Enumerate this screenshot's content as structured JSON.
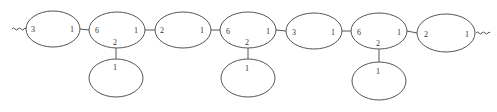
{
  "diagram": {
    "type": "chain-graph",
    "chain_nodes": [
      {
        "id": "A",
        "cx": 53,
        "cy": 29,
        "rx": 27,
        "ry": 18,
        "left": "3",
        "right": "1",
        "bottom": null
      },
      {
        "id": "B",
        "cx": 117,
        "cy": 30,
        "rx": 28,
        "ry": 18,
        "left": "6",
        "right": "1",
        "bottom": "2"
      },
      {
        "id": "C",
        "cx": 183,
        "cy": 30,
        "rx": 28,
        "ry": 18,
        "left": "2",
        "right": "1",
        "bottom": null
      },
      {
        "id": "D",
        "cx": 248,
        "cy": 30,
        "rx": 28,
        "ry": 18,
        "left": "6",
        "right": "1",
        "bottom": "2"
      },
      {
        "id": "E",
        "cx": 314,
        "cy": 31,
        "rx": 28,
        "ry": 18,
        "left": "3",
        "right": "1",
        "bottom": null
      },
      {
        "id": "F",
        "cx": 379,
        "cy": 31,
        "rx": 28,
        "ry": 18,
        "left": "6",
        "right": "1",
        "bottom": "2"
      },
      {
        "id": "G",
        "cx": 446,
        "cy": 33,
        "rx": 29,
        "ry": 19,
        "left": "2",
        "right": "1",
        "bottom": null
      }
    ],
    "child_nodes": [
      {
        "id": "B1",
        "parent": "B",
        "cx": 116,
        "cy": 78,
        "rx": 27,
        "ry": 19,
        "top": "1"
      },
      {
        "id": "D1",
        "parent": "D",
        "cx": 248,
        "cy": 78,
        "rx": 27,
        "ry": 19,
        "top": "1"
      },
      {
        "id": "F1",
        "parent": "F",
        "cx": 379,
        "cy": 81,
        "rx": 27,
        "ry": 19,
        "top": "1"
      }
    ],
    "open_ends": [
      "left-wavy",
      "right-wavy"
    ]
  }
}
